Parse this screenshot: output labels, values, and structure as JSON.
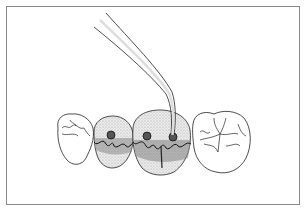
{
  "figure": {
    "elements": [
      {
        "name": "left-premolar",
        "shaded": false
      },
      {
        "name": "second-tooth",
        "shaded": true,
        "pits": 1
      },
      {
        "name": "third-molar-with-probe",
        "shaded": true,
        "pits": 2
      },
      {
        "name": "right-molar",
        "shaded": false
      },
      {
        "name": "dental-probe",
        "target": "third-molar-with-probe"
      }
    ],
    "colors": {
      "frame": "#8a8a8a",
      "line": "#222222",
      "shade": "#bdbdbd",
      "dark": "#333333"
    }
  }
}
